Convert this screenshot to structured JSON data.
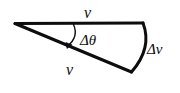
{
  "figure": {
    "name": "velocity-change-wedge-diagram",
    "background_color": "#ffffff",
    "stroke_color": "#0d0d0d",
    "labels": {
      "v_top": "v",
      "v_bottom": "v",
      "delta_theta": "Δθ",
      "delta_v": "Δv"
    },
    "icons": {
      "angle_arrow": "curved-arrow-icon"
    },
    "geometry": {
      "apex": [
        15,
        23
      ],
      "top_end": [
        143,
        23
      ],
      "bottom_end": [
        131,
        72
      ],
      "arc_control": [
        152,
        48
      ],
      "arrow_start": [
        73,
        25
      ],
      "arrow_end": [
        66,
        48
      ],
      "stroke_width_main": 3,
      "stroke_width_arrow": 1.4
    }
  }
}
